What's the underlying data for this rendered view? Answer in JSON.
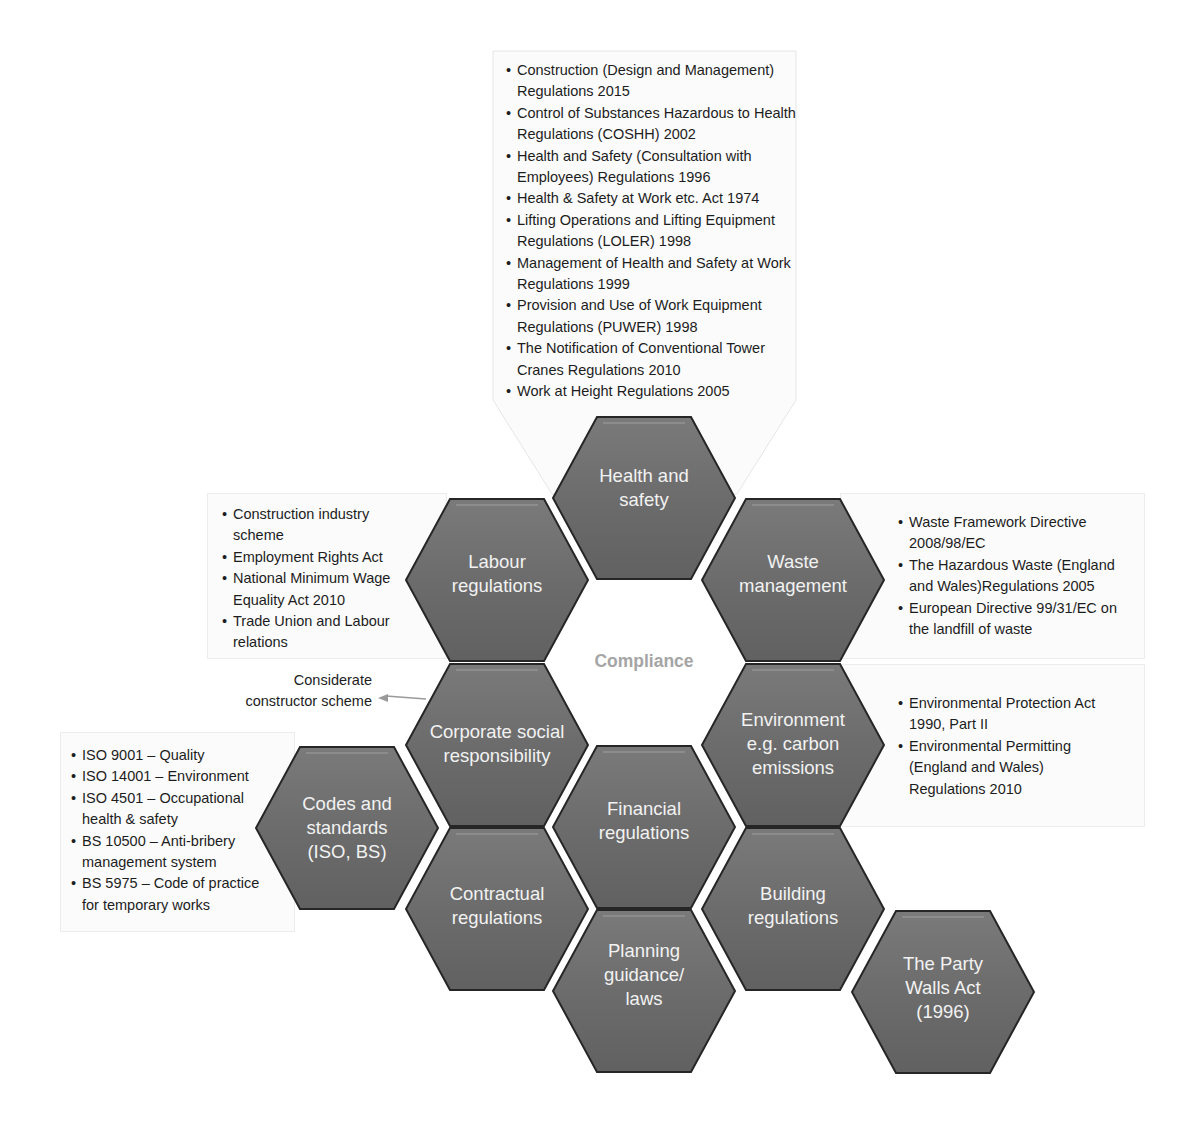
{
  "colors": {
    "hex_fill": "#6e6e6e",
    "hex_edge": "#262626",
    "hex_highlight": "#8c8c8c",
    "center_label": "#a5a5a5",
    "panel_bg": "#fbfbfb",
    "text": "#1d1d1d"
  },
  "center": {
    "label": "Compliance"
  },
  "hexagons": {
    "health_safety": "Health and safety",
    "labour": "Labour regulations",
    "waste": "Waste management",
    "csr": "Corporate social responsibility",
    "environment": "Environment e.g. carbon emissions",
    "financial": "Financial regulations",
    "codes": "Codes and standards (ISO, BS)",
    "contractual": "Contractual regulations",
    "building": "Building regulations",
    "planning": "Planning guidance/ laws",
    "party_walls": "The Party Walls Act (1996)"
  },
  "health_safety_list": [
    "Construction (Design and Management) Regulations 2015",
    "Control of Substances Hazardous to Health Regulations (COSHH) 2002",
    "Health and Safety (Consultation with Employees) Regulations 1996",
    "Health & Safety at Work etc. Act 1974",
    "Lifting Operations and Lifting Equipment Regulations (LOLER) 1998",
    "Management of Health and Safety at Work Regulations 1999",
    "Provision and Use of Work Equipment Regulations (PUWER) 1998",
    "The Notification of Conventional Tower Cranes Regulations 2010",
    "Work at Height Regulations 2005"
  ],
  "labour_list": [
    "Construction industry scheme",
    "Employment Rights Act",
    "National Minimum Wage Equality Act 2010",
    "Trade Union and Labour relations"
  ],
  "waste_list": [
    "Waste Framework Directive 2008/98/EC",
    "The Hazardous Waste (England and Wales)Regulations 2005",
    "European Directive 99/31/EC on the landfill of waste"
  ],
  "environment_list": [
    "Environmental Protection Act 1990, Part II",
    "Environmental Permitting (England and Wales) Regulations 2010"
  ],
  "codes_list": [
    "ISO 9001 – Quality",
    "ISO 14001 – Environment",
    "ISO 4501 – Occupational health & safety",
    "BS 10500 – Anti-bribery management system",
    "BS 5975 – Code of practice for temporary works"
  ],
  "csr_note": "Considerate constructor scheme"
}
